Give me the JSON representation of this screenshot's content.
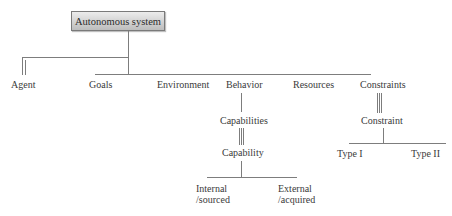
{
  "diagram": {
    "type": "hierarchy-tree",
    "root": {
      "label": "Autonomous system"
    },
    "level1": [
      {
        "id": "agent",
        "label": "Agent",
        "connector": "double-line"
      },
      {
        "id": "goals",
        "label": "Goals",
        "connector": "single-line"
      },
      {
        "id": "environment",
        "label": "Environment",
        "connector": "single-line"
      },
      {
        "id": "behavior",
        "label": "Behavior",
        "connector": "single-line"
      },
      {
        "id": "resources",
        "label": "Resources",
        "connector": "single-line"
      },
      {
        "id": "constraints",
        "label": "Constraints",
        "connector": "single-line"
      }
    ],
    "behavior_branch": {
      "capabilities": {
        "label": "Capabilities",
        "connector": "single-line"
      },
      "capability": {
        "label": "Capability",
        "connector": "triple-line"
      },
      "children": [
        {
          "id": "internal",
          "line1": "Internal",
          "line2": "/sourced"
        },
        {
          "id": "external",
          "line1": "External",
          "line2": "/acquired"
        }
      ]
    },
    "constraints_branch": {
      "constraint": {
        "label": "Constraint",
        "connector": "triple-line"
      },
      "children": [
        {
          "id": "type1",
          "label": "Type I"
        },
        {
          "id": "type2",
          "label": "Type II"
        }
      ]
    },
    "colors": {
      "line": "#7d7d7d",
      "text": "#3a3a3a",
      "box_fill_top": "#ececec",
      "box_fill_bottom": "#bdbdbd",
      "box_border": "#7a7a7a"
    }
  }
}
